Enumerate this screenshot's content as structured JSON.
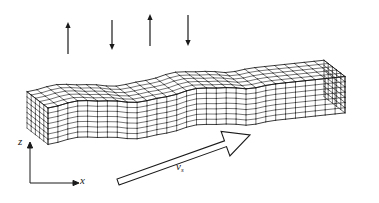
{
  "figure": {
    "background_color": "#ffffff",
    "line_color": "#1a1a1a",
    "projection": "isometric"
  },
  "axes": {
    "z_label": "z",
    "x_label": "x",
    "origin_px": [
      30,
      183
    ],
    "z_tip_px": [
      30,
      143
    ],
    "x_tip_px": [
      78,
      183
    ]
  },
  "motion_arrows": {
    "count": 4,
    "description": "alternating vertical particle-motion arrows above the wave",
    "items": [
      {
        "name": "arrow-up-1",
        "direction": "up",
        "x": 68,
        "y_top": 22,
        "y_bottom": 54
      },
      {
        "name": "arrow-down-1",
        "direction": "down",
        "x": 112,
        "y_top": 20,
        "y_bottom": 50
      },
      {
        "name": "arrow-up-2",
        "direction": "up",
        "x": 150,
        "y_top": 14,
        "y_bottom": 46
      },
      {
        "name": "arrow-down-2",
        "direction": "down",
        "x": 188,
        "y_top": 15,
        "y_bottom": 46
      }
    ]
  },
  "velocity_arrow": {
    "label_base": "v",
    "label_sub": "s",
    "label_text": "vs",
    "direction": "up-right",
    "style": "hollow outline block arrow",
    "label_px": [
      178,
      166
    ],
    "tail_px": [
      118,
      182
    ],
    "head_px": [
      250,
      135
    ]
  },
  "mesh": {
    "style": "quadrilateral wireframe",
    "columns": 30,
    "rows": 7,
    "depth_rows": 5,
    "wave_cycles": 2,
    "flat_section": "right third of slab is undeformed",
    "wave_amplitude_px": 22,
    "wavelength_px": 78
  },
  "chart_data": {
    "type": "line",
    "xlabel": "x",
    "ylabel": "z",
    "x": [
      0,
      10,
      20,
      30,
      40,
      50,
      60,
      70,
      80,
      90,
      100
    ],
    "values": [
      0.0,
      0.95,
      0.2,
      -0.9,
      -0.3,
      0.9,
      0.35,
      -0.85,
      -0.1,
      0.0,
      0.0
    ],
    "grid": true,
    "legend": "none"
  }
}
